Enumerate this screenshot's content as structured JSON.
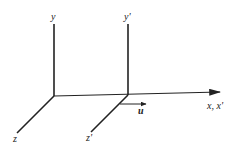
{
  "diagram": {
    "labels": {
      "y": "y",
      "y_prime": "y'",
      "z": "z",
      "z_prime": "z'",
      "x_axis": "x, x'",
      "velocity": "u"
    },
    "colors": {
      "line": "#222222",
      "background": "#ffffff"
    }
  }
}
